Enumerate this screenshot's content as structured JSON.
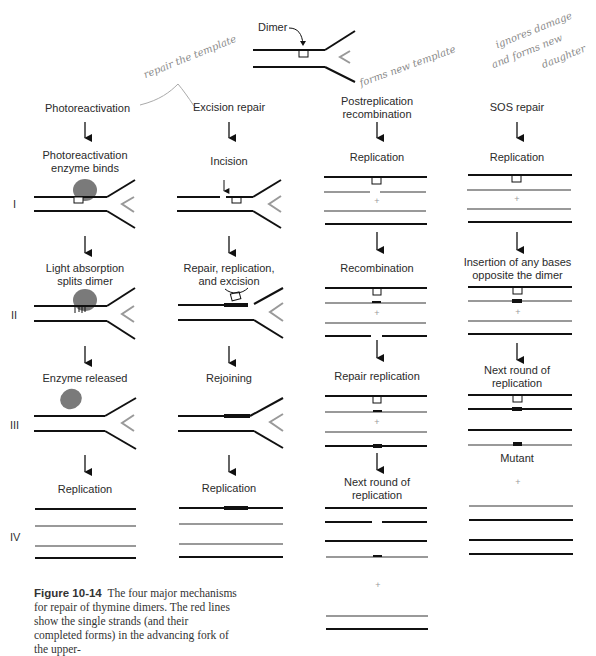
{
  "header": {
    "dimer_label": "Dimer"
  },
  "annotations": {
    "handwritten_1": "repair the template",
    "handwritten_2": "forms new template",
    "handwritten_3a": "ignores damage",
    "handwritten_3b": "and forms new",
    "handwritten_3c": "daughter"
  },
  "columns": [
    {
      "title": "Photoreactivation",
      "steps": [
        "Photoreactivation enzyme binds",
        "Light absorption splits dimer",
        "Enzyme released",
        "Replication"
      ]
    },
    {
      "title": "Excision repair",
      "steps": [
        "Incision",
        "Repair, replication, and excision",
        "Rejoining",
        "Replication"
      ]
    },
    {
      "title": "Postreplication recombination",
      "steps": [
        "Replication",
        "Recombination",
        "Repair replication",
        "Next round of replication"
      ]
    },
    {
      "title": "SOS repair",
      "steps": [
        "Replication",
        "Insertion of any bases opposite the dimer",
        "Next round of replication",
        "Mutant"
      ]
    }
  ],
  "col_text": {
    "c0_title": "Photoreactivation",
    "c1_title": "Excision repair",
    "c2_title_1": "Postreplication",
    "c2_title_2": "recombination",
    "c3_title": "SOS repair",
    "c0_s1a": "Photoreactivation",
    "c0_s1b": "enzyme binds",
    "c0_s2a": "Light absorption",
    "c0_s2b": "splits dimer",
    "c0_s3": "Enzyme released",
    "c0_s4": "Replication",
    "c1_s1": "Incision",
    "c1_s2a": "Repair, replication,",
    "c1_s2b": "and excision",
    "c1_s3": "Rejoining",
    "c1_s4": "Replication",
    "c2_s1": "Replication",
    "c2_s2": "Recombination",
    "c2_s3": "Repair replication",
    "c2_s4a": "Next round of",
    "c2_s4b": "replication",
    "c3_s1": "Replication",
    "c3_s2a": "Insertion of any bases",
    "c3_s2b": "opposite the dimer",
    "c3_s3a": "Next round of",
    "c3_s3b": "replication",
    "c3_s4": "Mutant"
  },
  "rows": [
    "I",
    "II",
    "III",
    "IV"
  ],
  "caption": {
    "figure_label": "Figure 10-14",
    "text": "The four major mechanisms for repair of thymine dimers. The red lines show the single strands (and their completed forms) in the advancing fork of the upper-"
  },
  "colors": {
    "parent_strand": "#1a1a1a",
    "new_strand": "#9a9a9a",
    "enzyme": "#7a7a7a",
    "handwriting": "#8a8a8a"
  }
}
